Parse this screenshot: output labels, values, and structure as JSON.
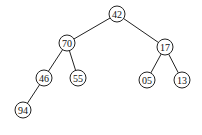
{
  "tree": {
    "radius": 8,
    "nodes": [
      {
        "id": "n42",
        "label": "42",
        "x": 117,
        "y": 14
      },
      {
        "id": "n70",
        "label": "70",
        "x": 67,
        "y": 43
      },
      {
        "id": "n17",
        "label": "17",
        "x": 165,
        "y": 47
      },
      {
        "id": "n46",
        "label": "46",
        "x": 44,
        "y": 78
      },
      {
        "id": "n55",
        "label": "55",
        "x": 78,
        "y": 78
      },
      {
        "id": "n05",
        "label": "05",
        "x": 147,
        "y": 80
      },
      {
        "id": "n13",
        "label": "13",
        "x": 182,
        "y": 80
      },
      {
        "id": "n94",
        "label": "94",
        "x": 23,
        "y": 110
      }
    ],
    "edges": [
      {
        "from": "n42",
        "to": "n70"
      },
      {
        "from": "n42",
        "to": "n17"
      },
      {
        "from": "n70",
        "to": "n46"
      },
      {
        "from": "n70",
        "to": "n55"
      },
      {
        "from": "n17",
        "to": "n05"
      },
      {
        "from": "n17",
        "to": "n13"
      },
      {
        "from": "n46",
        "to": "n94"
      }
    ]
  }
}
